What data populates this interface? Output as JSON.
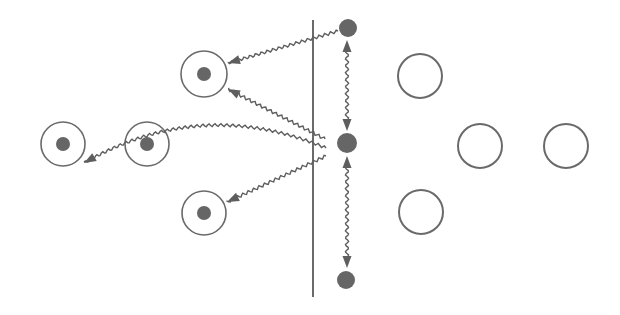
{
  "diagram": {
    "width": 620,
    "height": 315,
    "background": "#ffffff",
    "colors": {
      "stroke": "#6a6a6a",
      "fill_dot": "#666666",
      "arrow": "#5e5e5e",
      "boundary": "#6a6a6a"
    },
    "boundary": {
      "x": 313,
      "y1": 20,
      "y2": 297
    },
    "emitters": [
      {
        "id": "emitter-top",
        "cx": 348,
        "cy": 28,
        "r": 9
      },
      {
        "id": "emitter-middle",
        "cx": 347,
        "cy": 143,
        "r": 10
      },
      {
        "id": "emitter-bottom",
        "cx": 346,
        "cy": 280,
        "r": 9
      }
    ],
    "excited_atoms": [
      {
        "id": "atom-upper-left",
        "cx": 204,
        "cy": 74,
        "r": 23,
        "dot_r": 7
      },
      {
        "id": "atom-far-left",
        "cx": 63,
        "cy": 144,
        "r": 22,
        "dot_r": 7
      },
      {
        "id": "atom-mid-left",
        "cx": 147,
        "cy": 144,
        "r": 22,
        "dot_r": 7
      },
      {
        "id": "atom-lower-left",
        "cx": 204,
        "cy": 213,
        "r": 22,
        "dot_r": 7
      }
    ],
    "ground_atoms": [
      {
        "id": "atom-right-upper",
        "cx": 420,
        "cy": 76,
        "r": 22
      },
      {
        "id": "atom-right-middle",
        "cx": 480,
        "cy": 146,
        "r": 22
      },
      {
        "id": "atom-right-far",
        "cx": 566,
        "cy": 146,
        "r": 22
      },
      {
        "id": "atom-right-lower",
        "cx": 421,
        "cy": 212,
        "r": 22
      }
    ],
    "wavy_arrows": [
      {
        "id": "photon-top-to-upper-left",
        "from": [
          338,
          31
        ],
        "to": [
          228,
          63
        ],
        "curve": 0
      },
      {
        "id": "photon-middle-to-upper-left",
        "from": [
          325,
          139
        ],
        "to": [
          228,
          89
        ],
        "curve": 0
      },
      {
        "id": "photon-middle-to-far-left",
        "from": [
          326,
          148
        ],
        "to": [
          84,
          163
        ],
        "curve": 30
      },
      {
        "id": "photon-middle-to-lower-left",
        "from": [
          326,
          156
        ],
        "to": [
          227,
          202
        ],
        "curve": 0
      }
    ],
    "double_arrows": [
      {
        "id": "link-top-middle",
        "from": [
          347,
          40
        ],
        "to": [
          347,
          131
        ]
      },
      {
        "id": "link-middle-bottom",
        "from": [
          347,
          156
        ],
        "to": [
          347,
          268
        ]
      }
    ]
  }
}
